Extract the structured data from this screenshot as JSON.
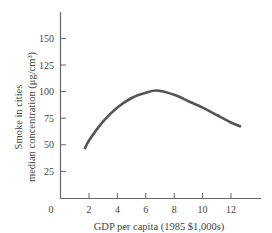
{
  "chart_data": {
    "type": "line",
    "title": "",
    "xlabel": "GDP per capita (1985 $1,000s)",
    "ylabel_lines": [
      "Smoke in cities",
      "median concentration (μg/cm³)"
    ],
    "ylabel": "Smoke in cities median concentration (μg/cm³)",
    "xlim": [
      0,
      14
    ],
    "ylim": [
      0,
      175
    ],
    "x_ticks": [
      2,
      4,
      6,
      8,
      10,
      12
    ],
    "y_ticks": [
      25,
      50,
      75,
      100,
      125,
      150
    ],
    "origin_label": "0",
    "grid": false,
    "legend": null,
    "series": [
      {
        "name": "Smoke concentration",
        "x": [
          1.7,
          2,
          3,
          4,
          5,
          6,
          6.8,
          8,
          9,
          10,
          11,
          12,
          12.7
        ],
        "y": [
          46,
          54,
          72,
          85,
          94,
          99,
          101,
          97,
          91,
          85,
          78,
          71,
          67
        ]
      }
    ],
    "line_color": "#555555"
  }
}
